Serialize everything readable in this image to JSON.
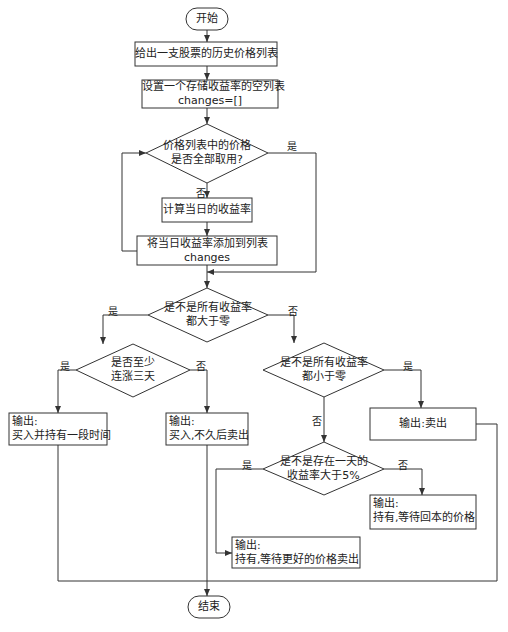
{
  "flowchart": {
    "start": "开始",
    "end": "结束",
    "step_given_prices": "给出一支股票的历史价格列表",
    "step_init_list_line1": "设置一个存储收益率的空列表",
    "step_init_list_line2": "changes=[]",
    "decision_all_used_line1": "价格列表中的价格",
    "decision_all_used_line2": "是否全部取用?",
    "step_compute_return": "计算当日的收益率",
    "step_append_line1": "将当日收益率添加到列表",
    "step_append_line2": "changes",
    "decision_all_positive_line1": "是不是所有收益率",
    "decision_all_positive_line2": "都大于零",
    "decision_three_days_line1": "是否至少",
    "decision_three_days_line2": "连涨三天",
    "decision_all_negative_line1": "是不是所有收益率",
    "decision_all_negative_line2": "都小于零",
    "decision_over5_line1": "是不是存在一天的",
    "decision_over5_line2": "收益率大于5%",
    "output_hold_long_line1": "输出:",
    "output_hold_long_line2": "买入并持有一段时间",
    "output_buy_sell_line1": "输出:",
    "output_buy_sell_line2": "买入,不久后卖出",
    "output_sell": "输出:卖出",
    "output_hold_break_even_line1": "输出:",
    "output_hold_break_even_line2": "持有,等待回本的价格",
    "output_hold_better_line1": "输出:",
    "output_hold_better_line2": "持有,等待更好的价格卖出"
  },
  "labels": {
    "yes": "是",
    "no": "否"
  },
  "colors": {
    "line": "#333333",
    "background": "#ffffff"
  }
}
